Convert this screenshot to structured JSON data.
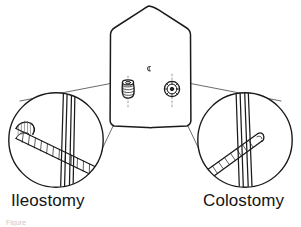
{
  "figure": {
    "background_color": "#ffffff",
    "line_color": "#1a1a1a",
    "width": 301,
    "height": 227
  },
  "labels": {
    "left": "Ileostomy",
    "right": "Colostomy"
  },
  "caption": {
    "partial_text": "Figure"
  },
  "torso": {
    "name": "abdomen-outline",
    "shape": "hexagon",
    "navel_marker": "c"
  },
  "stomas": [
    {
      "id": "ileostomy-stoma",
      "side": "left",
      "type": "spouted",
      "description": "Protruding spouted ileostomy stoma on left abdomen",
      "cx": 128,
      "cy": 89
    },
    {
      "id": "colostomy-stoma",
      "side": "right",
      "type": "flush",
      "description": "Flush circular colostomy stoma on right abdomen",
      "cx": 172,
      "cy": 89
    }
  ],
  "magnifiers": [
    {
      "id": "ileostomy-detail-circle",
      "side": "left",
      "cx": 56,
      "cy": 140,
      "r": 48,
      "description": "Cross-section of abdominal wall with protruding bowel spout"
    },
    {
      "id": "colostomy-detail-circle",
      "side": "right",
      "cx": 245,
      "cy": 140,
      "r": 48,
      "description": "Cross-section of abdominal wall with bowel sutured flush"
    }
  ]
}
